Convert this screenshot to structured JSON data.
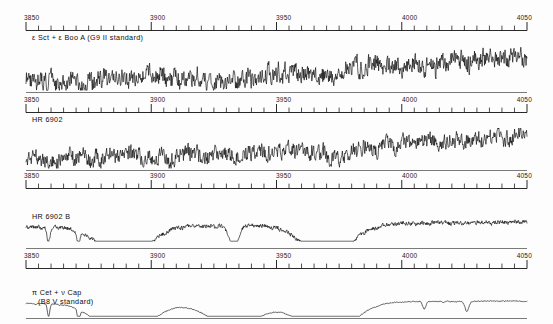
{
  "figure": {
    "background_color": "#fdfdfd",
    "trace_color": "#0a0a0a",
    "axis_color": "#111111",
    "baseline_color": "#7a7a7a"
  },
  "axis": {
    "unit": "Angstrom",
    "major_ticks": [
      "3850",
      "3900",
      "3950",
      "4000",
      "4050"
    ],
    "tick_values": [
      3850,
      3900,
      3950,
      4000,
      4050
    ],
    "minor_tick_step": 5,
    "range": [
      3850,
      4050
    ]
  },
  "panels": [
    {
      "id": "panel-1",
      "label": "ε Sct + ε Boo A (G9 II standard)",
      "label_line2": "",
      "tick_labels": [
        "3850",
        "3900",
        "3950",
        "4000",
        "4050"
      ]
    },
    {
      "id": "panel-2",
      "label": "HR 6902",
      "label_line2": "",
      "tick_labels": [
        "3850",
        "3900",
        "3950",
        "4000",
        "4050"
      ]
    },
    {
      "id": "panel-3",
      "label": "HR 6902 B",
      "label_line2": "",
      "tick_labels": [
        "3850",
        "3900",
        "3950",
        "4000",
        "4050"
      ]
    },
    {
      "id": "panel-4",
      "label": "π Cet + ν Cap",
      "label_line2": "(B8 V standard)",
      "tick_labels": [
        "3850",
        "3900",
        "3950",
        "4000",
        "4050"
      ]
    }
  ],
  "chart_data": {
    "type": "line",
    "xlabel": "Wavelength (Å)",
    "ylabel": "Relative flux",
    "xlim": [
      3850,
      4050
    ],
    "grid": false,
    "legend": "none",
    "series": [
      {
        "name": "ε Sct + ε Boo A (G9 II standard)",
        "panel": 1,
        "description": "Composite late-type giant standard; dense metallic line blanketing, strong Ca II H and K depressions near 3933 and 3968, rising continuum toward 4050",
        "broad_features": [
          {
            "center": 3933,
            "name": "Ca II K",
            "depth": 0.55
          },
          {
            "center": 3968,
            "name": "Ca II H",
            "depth": 0.5
          }
        ],
        "noise_amplitude": 0.3,
        "continuum_slope": 0.55
      },
      {
        "name": "HR 6902",
        "panel": 2,
        "description": "Composite binary spectrum; noisy metallic lines with broad depression near 3968-3980 and rising continuum toward 4050",
        "broad_features": [
          {
            "center": 3933,
            "name": "Ca II K",
            "depth": 0.3
          },
          {
            "center": 3975,
            "name": "Ca II H + H-epsilon",
            "depth": 0.62
          }
        ],
        "noise_amplitude": 0.28,
        "continuum_slope": 0.6
      },
      {
        "name": "HR 6902 B",
        "panel": 3,
        "description": "Reconstructed hot secondary; smooth continuum with strong broad Balmer absorption lines H8 3889, H-epsilon 3970 and sharp Ca II K 3933",
        "broad_features": [
          {
            "center": 3889,
            "name": "H8",
            "depth": 0.8
          },
          {
            "center": 3970,
            "name": "H-epsilon",
            "depth": 0.82
          },
          {
            "center": 3933,
            "name": "Ca II K (sharp)",
            "depth": 0.55
          }
        ],
        "noise_amplitude": 0.055,
        "continuum_slope": 0.1
      },
      {
        "name": "π Cet + ν Cap (B8 V standard)",
        "panel": 4,
        "description": "Clean early B-type dwarf standard; very smooth continuum, deep broad Balmer lines H8 3889 and H-epsilon 3970, narrow interstellar Ca II K 3933",
        "broad_features": [
          {
            "center": 3889,
            "name": "H8",
            "depth": 0.85
          },
          {
            "center": 3970,
            "name": "H-epsilon",
            "depth": 0.86
          },
          {
            "center": 3933,
            "name": "Ca II K (interstellar)",
            "depth": 0.6
          }
        ],
        "noise_amplitude": 0.012,
        "continuum_slope": 0.05
      }
    ]
  }
}
